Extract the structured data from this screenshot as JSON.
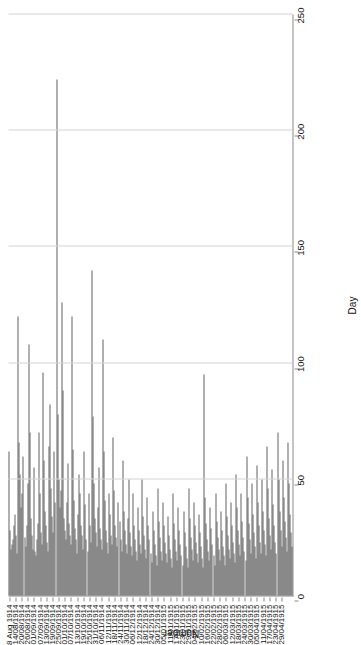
{
  "chart_data": {
    "type": "bar",
    "orientation": "vertical-rendered-rotated",
    "title": "",
    "xlabel": "Day",
    "ylabel": "Number",
    "ylim": [
      0,
      250
    ],
    "yticks": [
      0,
      50,
      100,
      150,
      200,
      250
    ],
    "grid": "y-gridlines-only",
    "legend": "none",
    "tick_labels": [
      "4-8 Aug 1914",
      "14/08/1914",
      "20/08/1914",
      "26/08/1914",
      "01/09/1914",
      "07/09/1914",
      "13/09/1914",
      "19/09/1914",
      "25/09/1914",
      "01/10/1914",
      "07/10/1914",
      "13/10/1914",
      "19/10/1914",
      "25/10/1914",
      "31/10/1914",
      "06/11/1914",
      "12/11/1914",
      "18/11/1914",
      "24/11/1914",
      "30/11/1914",
      "06/12/1914",
      "12/12/1914",
      "18/12/1914",
      "24/12/1914",
      "30/12/1914",
      "05/01/1915",
      "11/01/1915",
      "17/01/1915",
      "23/01/1915",
      "29/01/1915",
      "04/02/1915",
      "10/02/1915",
      "16/02/1915",
      "22/02/1915",
      "28/02/1915",
      "06/03/1915",
      "12/03/1915",
      "18/03/1915",
      "24/03/1915",
      "30/03/1915",
      "05/04/1915",
      "11/04/1915",
      "17/04/1915",
      "23/04/1915",
      "29/04/1915"
    ],
    "tick_every": 6,
    "bar_color": "#636363",
    "values": [
      62,
      28,
      20,
      22,
      24,
      30,
      35,
      26,
      18,
      120,
      66,
      52,
      38,
      44,
      60,
      25,
      21,
      30,
      48,
      108,
      70,
      33,
      26,
      20,
      55,
      19,
      17,
      24,
      31,
      70,
      44,
      27,
      22,
      96,
      58,
      36,
      30,
      23,
      19,
      64,
      82,
      46,
      34,
      27,
      62,
      40,
      222,
      78,
      50,
      38,
      45,
      126,
      88,
      33,
      28,
      24,
      40,
      57,
      31,
      26,
      22,
      120,
      63,
      41,
      29,
      24,
      18,
      35,
      52,
      44,
      30,
      26,
      20,
      62,
      39,
      24,
      19,
      44,
      30,
      23,
      140,
      77,
      48,
      33,
      27,
      21,
      38,
      55,
      29,
      24,
      20,
      110,
      62,
      41,
      28,
      23,
      18,
      44,
      35,
      26,
      22,
      68,
      45,
      30,
      25,
      21,
      40,
      32,
      24,
      19,
      58,
      36,
      28,
      22,
      18,
      33,
      50,
      27,
      21,
      17,
      44,
      30,
      24,
      19,
      15,
      38,
      28,
      22,
      18,
      50,
      34,
      26,
      20,
      16,
      42,
      30,
      24,
      18,
      14,
      36,
      28,
      22,
      17,
      13,
      46,
      32,
      25,
      19,
      15,
      40,
      30,
      23,
      18,
      14,
      34,
      26,
      20,
      16,
      12,
      44,
      31,
      24,
      19,
      15,
      38,
      28,
      22,
      17,
      13,
      36,
      27,
      21,
      16,
      12,
      46,
      33,
      25,
      20,
      15,
      40,
      30,
      23,
      18,
      14,
      35,
      27,
      21,
      16,
      12,
      95,
      42,
      31,
      24,
      19,
      15,
      38,
      29,
      22,
      17,
      13,
      44,
      32,
      25,
      20,
      15,
      36,
      28,
      21,
      17,
      13,
      48,
      34,
      26,
      20,
      16,
      40,
      30,
      23,
      18,
      14,
      52,
      38,
      28,
      22,
      17,
      44,
      32,
      25,
      19,
      15,
      60,
      42,
      31,
      24,
      18,
      48,
      35,
      27,
      21,
      16,
      56,
      40,
      30,
      23,
      18,
      50,
      36,
      28,
      22,
      17,
      64,
      46,
      33,
      26,
      20,
      54,
      39,
      30,
      23,
      18,
      70,
      50,
      36,
      28,
      21,
      58,
      42,
      32,
      25,
      19,
      66,
      48,
      35,
      27,
      21
    ]
  }
}
